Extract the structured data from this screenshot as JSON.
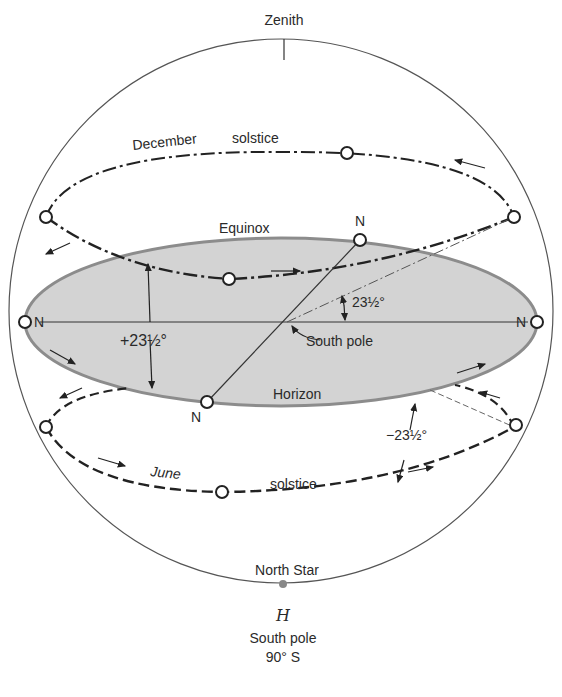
{
  "figure": {
    "title_letter": "H",
    "caption_line1": "South pole",
    "caption_line2": "90° S"
  },
  "labels": {
    "zenith": "Zenith",
    "december": "December",
    "december_solstice": "solstice",
    "equinox": "Equinox",
    "horizon": "Horizon",
    "june": "June",
    "june_solstice": "solstice",
    "north_star": "North Star",
    "south_pole": "South pole",
    "north_top": "N",
    "north_bottom": "N",
    "north_left": "N",
    "north_right": "N",
    "angle_plus": "+23½°",
    "angle_minus": "−23½°",
    "angle_center": "23½°"
  },
  "colors": {
    "horizon_fill": "#d3d3d3",
    "horizon_edge": "#8c8c8c",
    "line": "#222222",
    "sphere": "#555555"
  }
}
